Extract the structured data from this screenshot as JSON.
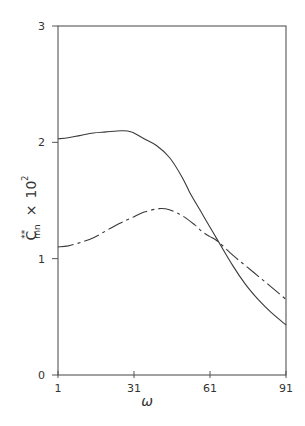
{
  "chart_data": {
    "type": "line",
    "title": "",
    "xlabel": "ω",
    "ylabel": "C**mn × 10²",
    "ylabel_parts": {
      "base": "C",
      "sup": "**",
      "sub": "mn",
      "times": "×",
      "power_base": "10",
      "power": "2"
    },
    "xlim": [
      1,
      91
    ],
    "ylim": [
      0,
      3
    ],
    "xticks": [
      1,
      31,
      61,
      91
    ],
    "xtick_labels": [
      "1",
      "31",
      "61",
      "91"
    ],
    "yticks": [
      0,
      1,
      2,
      3
    ],
    "ytick_labels": [
      "0",
      "1",
      "2",
      "3"
    ],
    "grid": false,
    "legend": null,
    "series": [
      {
        "name": "solid",
        "style": "solid",
        "x": [
          1,
          5,
          10,
          15,
          20,
          26,
          30,
          35,
          40,
          45,
          50,
          53,
          57,
          61,
          64,
          70,
          75,
          80,
          85,
          91
        ],
        "values": [
          2.03,
          2.04,
          2.06,
          2.08,
          2.09,
          2.1,
          2.09,
          2.03,
          1.97,
          1.87,
          1.7,
          1.57,
          1.42,
          1.27,
          1.16,
          0.94,
          0.78,
          0.65,
          0.54,
          0.43
        ]
      },
      {
        "name": "dash-dot",
        "style": "dashdot",
        "x": [
          1,
          5,
          10,
          15,
          20,
          25,
          30,
          35,
          41,
          45,
          50,
          55,
          58,
          61,
          64,
          70,
          75,
          80,
          85,
          91
        ],
        "values": [
          1.1,
          1.11,
          1.14,
          1.18,
          1.24,
          1.3,
          1.35,
          1.4,
          1.43,
          1.42,
          1.37,
          1.29,
          1.23,
          1.19,
          1.15,
          1.03,
          0.94,
          0.85,
          0.76,
          0.65
        ]
      }
    ]
  },
  "colors": {
    "line": "#3a3a3a",
    "axis": "#555555",
    "background": "#ffffff"
  }
}
